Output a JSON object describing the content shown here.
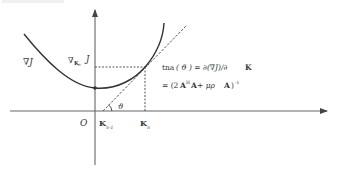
{
  "diagram": {
    "axes": {
      "origin_label": "O",
      "y_axis_label": "J",
      "x_axis_arrow": "right",
      "y_axis_arrow": "up"
    },
    "curve": {
      "label": "∇J",
      "description": "convex curve with minimum on the vertical axis"
    },
    "point_labels": {
      "gradient_at_kn": "∇",
      "gradient_sub": "K",
      "gradient_sub_sub": "n",
      "j_value": "J",
      "k_prev": "K",
      "k_prev_sub": "n-1",
      "k_n": "K",
      "k_n_sub": "n"
    },
    "angle_label": "ϑ",
    "formula": {
      "line1_a": "tna",
      "line1_b": "( ϑ ) = ∂(∇J)/∂",
      "line1_c": "K",
      "line2_a": "= (2",
      "line2_b": "A",
      "line2_sup": "H",
      "line2_c": "A",
      "line2_d": " + μρ",
      "line2_e": "A",
      "line2_f": ")",
      "line2_sup2": "-1"
    },
    "colors": {
      "line": "#333333",
      "axis": "#555555",
      "dashed": "#444444",
      "text": "#333333"
    }
  }
}
